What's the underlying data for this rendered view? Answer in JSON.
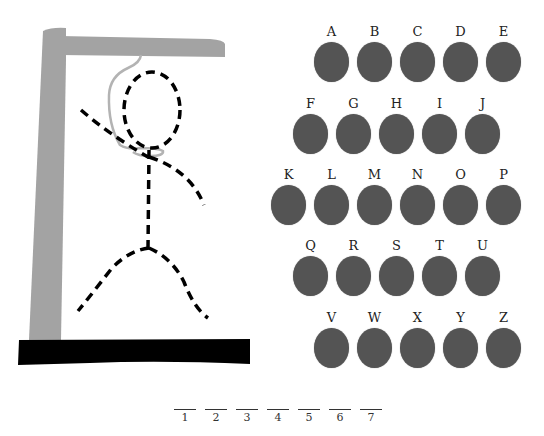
{
  "game": "hangman",
  "colors": {
    "gallows": "#a3a3a3",
    "base": "#000000",
    "rope": "#b3b3b3",
    "figure": "#000000",
    "key": "#545454"
  },
  "keyboard": {
    "rows": [
      {
        "x": 314,
        "y": 42,
        "letters": [
          "A",
          "B",
          "C",
          "D",
          "E"
        ]
      },
      {
        "x": 293,
        "y": 114,
        "letters": [
          "F",
          "G",
          "H",
          "I",
          "J"
        ]
      },
      {
        "x": 271,
        "y": 185,
        "letters": [
          "K",
          "L",
          "M",
          "N",
          "O",
          "P"
        ]
      },
      {
        "x": 293,
        "y": 256,
        "letters": [
          "Q",
          "R",
          "S",
          "T",
          "U"
        ]
      },
      {
        "x": 314,
        "y": 328,
        "letters": [
          "V",
          "W",
          "X",
          "Y",
          "Z"
        ]
      }
    ],
    "spacing": 43
  },
  "word_slots": [
    "1",
    "2",
    "3",
    "4",
    "5",
    "6",
    "7"
  ]
}
